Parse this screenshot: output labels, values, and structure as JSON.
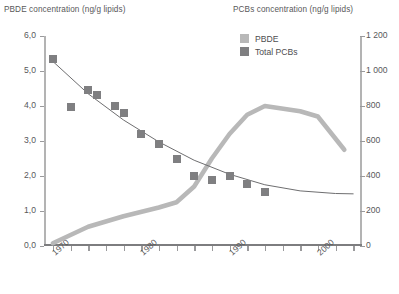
{
  "titles": {
    "left_axis": "PBDE concentration (ng/g lipids)",
    "right_axis": "PCBs concentration (ng/g lipids)"
  },
  "legend": {
    "position": "top-center-right",
    "items": [
      {
        "label": "PBDE",
        "color": "#b8b8b8",
        "icon": "square-swatch"
      },
      {
        "label": "Total PCBs",
        "color": "#7f7f81",
        "icon": "square-swatch"
      }
    ]
  },
  "chart_data": {
    "type": "line",
    "title": "",
    "subtitle": "",
    "xlabel": "",
    "ylabel": "PBDE concentration (ng/g lipids)",
    "ylabel_right": "PCBs concentration (ng/g lipids)",
    "grid": false,
    "legend_position": "top-right",
    "xlim": [
      1969,
      2005
    ],
    "x_ticks": [
      1970,
      1972,
      1974,
      1976,
      1978,
      1980,
      1982,
      1984,
      1986,
      1988,
      1990,
      1992,
      1994,
      1996,
      1998,
      2000,
      2002,
      2004
    ],
    "x_tick_labels": [
      "1970",
      "",
      "",
      "",
      "",
      "1980",
      "",
      "",
      "",
      "",
      "1990",
      "",
      "",
      "",
      "",
      "2000",
      "",
      ""
    ],
    "x_labeled_ticks": [
      "1970",
      "1980",
      "1990",
      "2000"
    ],
    "ylim_left": [
      0.0,
      6.0
    ],
    "y_ticks_left": [
      0.0,
      1.0,
      2.0,
      3.0,
      4.0,
      5.0,
      6.0
    ],
    "y_tick_labels_left": [
      "0,0",
      "1,0",
      "2,0",
      "3,0",
      "4,0",
      "5,0",
      "6,0"
    ],
    "ylim_right": [
      0,
      1200
    ],
    "y_ticks_right": [
      0,
      200,
      400,
      600,
      800,
      1000,
      1200
    ],
    "y_tick_labels_right": [
      "0",
      "200",
      "400",
      "600",
      "800",
      "1 000",
      "1 200"
    ],
    "series": [
      {
        "name": "PBDE",
        "axis": "left",
        "style": "line",
        "color": "#b8b8b8",
        "width": 4.5,
        "x": [
          1970,
          1974,
          1978,
          1982,
          1984,
          1986,
          1988,
          1990,
          1992,
          1994,
          1998,
          2000,
          2003
        ],
        "values": [
          0.08,
          0.55,
          0.85,
          1.1,
          1.25,
          1.7,
          2.5,
          3.2,
          3.75,
          4.0,
          3.85,
          3.7,
          2.75
        ]
      },
      {
        "name": "Total PCBs",
        "axis": "right",
        "style": "scatter-with-trend",
        "color": "#7f7f81",
        "trend_color": "#6e6e70",
        "x": [
          1970,
          1972,
          1974,
          1975,
          1977,
          1978,
          1980,
          1982,
          1984,
          1986,
          1988,
          1990,
          1992,
          1994
        ],
        "values": [
          1070,
          795,
          890,
          865,
          800,
          760,
          640,
          585,
          500,
          400,
          375,
          400,
          355,
          310
        ],
        "trend_x": [
          1970,
          1974,
          1978,
          1982,
          1986,
          1990,
          1994,
          1998,
          2002,
          2004
        ],
        "trend_values": [
          1055,
          870,
          720,
          595,
          490,
          410,
          350,
          315,
          300,
          298
        ]
      }
    ]
  }
}
